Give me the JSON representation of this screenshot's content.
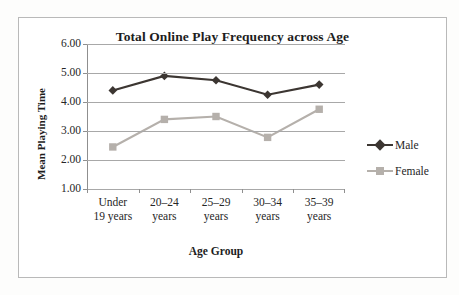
{
  "chart_data": {
    "type": "line",
    "title": "Total Online Play Frequency across Age",
    "xlabel": "Age Group",
    "ylabel": "Mean Playing Time",
    "categories": [
      "Under\n19 years",
      "20–24\nyears",
      "25–29\nyears",
      "30–34\nyears",
      "35–39\nyears"
    ],
    "category_labels_flat": [
      "Under 19 years",
      "20–24 years",
      "25–29 years",
      "30–34 years",
      "35–39 years"
    ],
    "ylim": [
      1.0,
      6.0
    ],
    "ytick_labels": [
      "6.00",
      "5.00",
      "4.00",
      "3.00",
      "2.00",
      "1.00"
    ],
    "ytick_values": [
      6.0,
      5.0,
      4.0,
      3.0,
      2.0,
      1.0
    ],
    "grid": true,
    "legend_position": "right",
    "series": [
      {
        "name": "Male",
        "values": [
          4.4,
          4.9,
          4.75,
          4.25,
          4.6
        ],
        "color": "#3c3632",
        "marker": "diamond"
      },
      {
        "name": "Female",
        "values": [
          2.45,
          3.4,
          3.5,
          2.78,
          3.75
        ],
        "color": "#b5b0ab",
        "marker": "square"
      }
    ]
  },
  "frame": {
    "border_color": "#b9b9b9",
    "gridline_color": "#a8a8a8"
  }
}
